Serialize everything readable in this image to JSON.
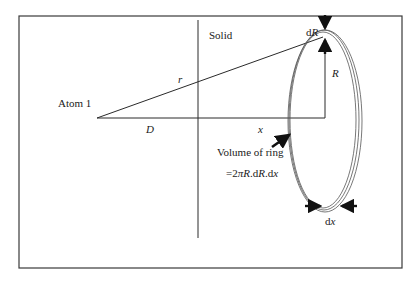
{
  "diagram": {
    "labels": {
      "solid": "Solid",
      "atom": "Atom 1",
      "r": "r",
      "D": "D",
      "x": "x",
      "R": "R",
      "dR_prefix": "d",
      "dR_var": "R",
      "volume_title": "Volume of ring",
      "volume_formula_prefix": "=2",
      "volume_formula_pi": "π",
      "volume_formula_R": "R",
      "volume_formula_mid": ".d",
      "volume_formula_R2": "R",
      "volume_formula_tail": ".d",
      "volume_formula_x": "x",
      "dx_prefix": "d",
      "dx_var": "x"
    },
    "colors": {
      "line": "#2a2a2a",
      "frame": "#3a3a3a",
      "ring": "#555555",
      "arrow": "#111111",
      "background": "#ffffff"
    }
  }
}
